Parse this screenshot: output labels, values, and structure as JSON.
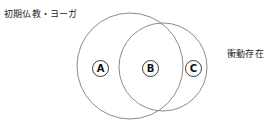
{
  "diagram": {
    "type": "venn",
    "width": 273,
    "height": 125,
    "background": "#ffffff",
    "stroke_color": "#8a8a8a",
    "labels": {
      "left_set": "初期仏教・ヨーガ",
      "right_set": "衝動存在"
    },
    "regions": [
      {
        "id": "A",
        "label": "A",
        "meaning": "left-only"
      },
      {
        "id": "B",
        "label": "B",
        "meaning": "intersection"
      },
      {
        "id": "C",
        "label": "C",
        "meaning": "right-only"
      }
    ],
    "circles": [
      {
        "id": "left-circle",
        "cx": 130,
        "cy": 66,
        "r": 53
      },
      {
        "id": "right-circle",
        "cx": 163,
        "cy": 67,
        "r": 44
      }
    ]
  }
}
